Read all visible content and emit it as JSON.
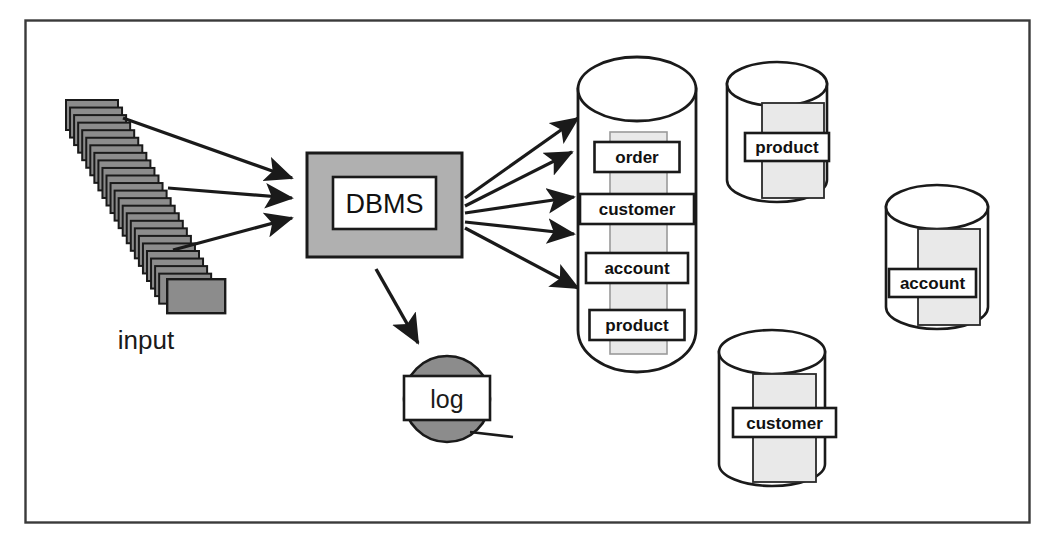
{
  "diagram": {
    "frame": {
      "name": "outer-border",
      "x": 25,
      "y": 20,
      "width": 1005,
      "height": 503
    },
    "colors": {
      "line": "#1a1a1a",
      "card_fill": "#8c8c8c",
      "dbms_fill": "#b0b0b0",
      "log_fill": "#8c8c8c",
      "table_fill": "#e9e9e9",
      "background": "#ffffff"
    },
    "input": {
      "label": "input",
      "card_count": 24
    },
    "processor": {
      "label": "DBMS"
    },
    "log": {
      "label": "log"
    },
    "main_store": {
      "name": "central-database-cylinder",
      "tables": [
        {
          "label": "order"
        },
        {
          "label": "customer"
        },
        {
          "label": "account"
        },
        {
          "label": "product"
        }
      ]
    },
    "replica_stores": [
      {
        "label": "product"
      },
      {
        "label": "account"
      },
      {
        "label": "customer"
      }
    ],
    "arrows": {
      "input_to_dbms_count": 3,
      "dbms_to_store_count": 5,
      "dbms_to_log_count": 1
    }
  }
}
